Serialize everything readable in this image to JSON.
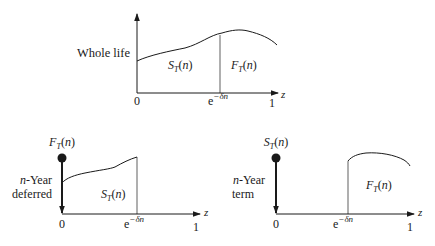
{
  "panels": [
    {
      "id": "whole-life",
      "label_lines": [
        "Whole life"
      ],
      "region_labels": {
        "left": "S",
        "left_sub": "T",
        "left_arg": "(n)",
        "right": "F",
        "right_sub": "T",
        "right_arg": "(n)"
      },
      "x_ticks": [
        "0",
        "e",
        "1"
      ],
      "delta_exp": "−δn",
      "axis_label": "z"
    },
    {
      "id": "n-year-deferred",
      "label_lines": [
        "n",
        "-Year",
        "deferred"
      ],
      "top_label": {
        "main": "F",
        "sub": "T",
        "arg": "(n)"
      },
      "region_label": {
        "main": "S",
        "sub": "T",
        "arg": "(n)"
      },
      "x_ticks": [
        "0",
        "e",
        "1"
      ],
      "delta_exp": "−δn",
      "axis_label": "z"
    },
    {
      "id": "n-year-term",
      "label_lines": [
        "n",
        "-Year",
        "term"
      ],
      "top_label": {
        "main": "S",
        "sub": "T",
        "arg": "(n)"
      },
      "region_label": {
        "main": "F",
        "sub": "T",
        "arg": "(n)"
      },
      "x_ticks": [
        "0",
        "e",
        "1"
      ],
      "delta_exp": "−δn",
      "axis_label": "z"
    }
  ]
}
